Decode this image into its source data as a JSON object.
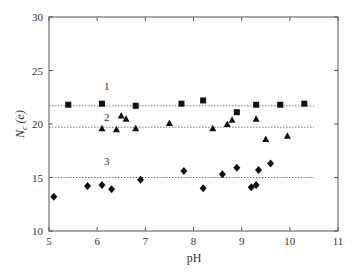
{
  "chart_data": {
    "type": "scatter",
    "title": "",
    "xlabel": "pH",
    "ylabel": "N_c (e)",
    "xlim": [
      5,
      11
    ],
    "ylim": [
      10,
      30
    ],
    "xticks": [
      5,
      6,
      7,
      8,
      9,
      10,
      11
    ],
    "yticks": [
      10,
      15,
      20,
      25,
      30
    ],
    "grid": false,
    "legend": null,
    "series": [
      {
        "name": "1",
        "marker": "square",
        "reference_line": 21.7,
        "points": [
          [
            5.4,
            21.8
          ],
          [
            6.1,
            21.9
          ],
          [
            6.8,
            21.7
          ],
          [
            7.75,
            21.9
          ],
          [
            8.2,
            22.2
          ],
          [
            8.9,
            21.1
          ],
          [
            9.3,
            21.8
          ],
          [
            9.8,
            21.8
          ],
          [
            10.3,
            21.9
          ]
        ]
      },
      {
        "name": "2",
        "marker": "triangle",
        "reference_line": 19.7,
        "points": [
          [
            6.1,
            19.6
          ],
          [
            6.4,
            19.5
          ],
          [
            6.5,
            20.8
          ],
          [
            6.6,
            20.5
          ],
          [
            6.8,
            19.6
          ],
          [
            7.5,
            20.1
          ],
          [
            8.4,
            19.6
          ],
          [
            8.7,
            20.0
          ],
          [
            8.8,
            20.4
          ],
          [
            9.3,
            20.5
          ],
          [
            9.5,
            18.6
          ],
          [
            9.95,
            18.9
          ]
        ]
      },
      {
        "name": "3",
        "marker": "diamond",
        "reference_line": 15.0,
        "points": [
          [
            5.1,
            13.2
          ],
          [
            5.8,
            14.2
          ],
          [
            6.1,
            14.3
          ],
          [
            6.3,
            13.9
          ],
          [
            6.9,
            14.8
          ],
          [
            7.8,
            15.6
          ],
          [
            8.2,
            14.0
          ],
          [
            8.6,
            15.3
          ],
          [
            8.9,
            15.9
          ],
          [
            9.2,
            14.1
          ],
          [
            9.3,
            14.3
          ],
          [
            9.35,
            15.7
          ],
          [
            9.6,
            16.3
          ]
        ]
      }
    ],
    "annotations": [
      {
        "text": "1",
        "x": 6.2,
        "y": 23.2
      },
      {
        "text": "2",
        "x": 6.2,
        "y": 20.3
      },
      {
        "text": "3",
        "x": 6.2,
        "y": 16.2
      }
    ]
  }
}
